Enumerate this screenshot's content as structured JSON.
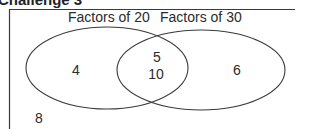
{
  "heading": "Challenge 3",
  "venn": {
    "sets": [
      {
        "label": "Factors of 20",
        "only": [
          "4"
        ]
      },
      {
        "label": "Factors of 30",
        "only": [
          "6"
        ]
      }
    ],
    "intersection": [
      "5",
      "10"
    ],
    "outside": [
      "8"
    ]
  },
  "colors": {
    "line": "#3a3a3a",
    "text": "#2b2b2b",
    "background": "#ffffff"
  }
}
